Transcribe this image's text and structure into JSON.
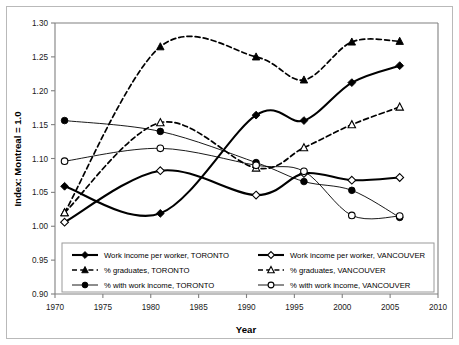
{
  "chart_data": {
    "type": "line",
    "title": "",
    "xlabel": "Year",
    "ylabel": "Index: Montreal = 1.0",
    "xlim": [
      1970,
      2010
    ],
    "ylim": [
      0.9,
      1.3
    ],
    "ytick_step": 0.05,
    "xtick_step": 5,
    "grid": false,
    "legend_position": "inside-bottom",
    "xticks": [
      "1970",
      "1975",
      "1980",
      "1985",
      "1990",
      "1995",
      "2000",
      "2005",
      "2010"
    ],
    "yticks": [
      "0.90",
      "0.95",
      "1.00",
      "1.05",
      "1.10",
      "1.15",
      "1.20",
      "1.25",
      "1.30"
    ],
    "x": [
      1971,
      1981,
      1991,
      1996,
      2001,
      2006
    ],
    "series": [
      {
        "name": "Work income per worker, TORONTO",
        "marker": "filled-diamond",
        "line": "solid-thick",
        "values": [
          1.059,
          1.019,
          1.164,
          1.156,
          1.212,
          1.237
        ]
      },
      {
        "name": "% graduates, TORONTO",
        "marker": "filled-triangle",
        "line": "dashed",
        "values": [
          1.02,
          1.265,
          1.25,
          1.216,
          1.272,
          1.273
        ]
      },
      {
        "name": "% with work income, TORONTO",
        "marker": "filled-circle",
        "line": "solid-thin",
        "values": [
          1.156,
          1.14,
          1.094,
          1.066,
          1.053,
          1.013
        ]
      },
      {
        "name": "Work income per worker, VANCOUVER",
        "marker": "open-diamond",
        "line": "solid-thick",
        "values": [
          1.006,
          1.082,
          1.046,
          1.078,
          1.068,
          1.072
        ]
      },
      {
        "name": "% graduates, VANCOUVER",
        "marker": "open-triangle",
        "line": "dashed",
        "values": [
          1.02,
          1.153,
          1.086,
          1.116,
          1.15,
          1.176
        ]
      },
      {
        "name": "% with work income, VANCOUVER",
        "marker": "open-circle",
        "line": "solid-thin",
        "values": [
          1.096,
          1.115,
          1.09,
          1.081,
          1.016,
          1.015
        ]
      }
    ]
  },
  "legend": {
    "entries": [
      {
        "label": "Work income per worker, TORONTO"
      },
      {
        "label": "Work income per worker, VANCOUVER"
      },
      {
        "label": "% graduates, TORONTO"
      },
      {
        "label": "% graduates, VANCOUVER"
      },
      {
        "label": "% with work income, TORONTO"
      },
      {
        "label": "% with work income, VANCOUVER"
      }
    ]
  },
  "colors": {
    "ink": "#000000",
    "axis": "#808080",
    "frame": "#b9b9b9",
    "background": "#ffffff"
  }
}
